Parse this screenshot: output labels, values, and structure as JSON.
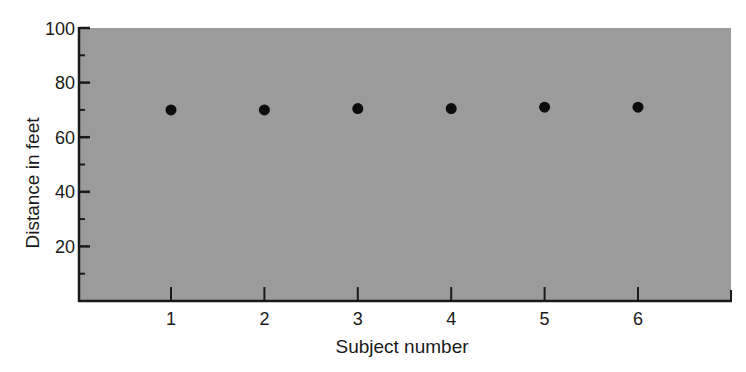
{
  "chart_data": {
    "type": "scatter",
    "title": "",
    "xlabel": "Subject number",
    "ylabel": "Distance in feet",
    "categories": [
      "1",
      "2",
      "3",
      "4",
      "5",
      "6"
    ],
    "x": [
      1,
      2,
      3,
      4,
      5,
      6
    ],
    "values": [
      70,
      70,
      70.5,
      70.5,
      71,
      71
    ],
    "series": [
      {
        "name": "Distance",
        "x": [
          1,
          2,
          3,
          4,
          5,
          6
        ],
        "values": [
          70,
          70,
          70.5,
          70.5,
          71,
          71
        ]
      }
    ],
    "xlim": [
      0,
      7
    ],
    "ylim": [
      0,
      100
    ],
    "yticks_major": [
      20,
      40,
      60,
      80,
      100
    ],
    "yticks_minor": [
      10,
      30,
      50,
      70,
      90
    ],
    "ytick_labels": [
      "20",
      "40",
      "60",
      "80",
      "100"
    ],
    "xticks": [
      1,
      2,
      3,
      4,
      5,
      6
    ],
    "xtick_labels": [
      "1",
      "2",
      "3",
      "4",
      "5",
      "6"
    ],
    "grid": false,
    "legend": null,
    "colors": {
      "plot_background": "#9b9b9b",
      "marker": "#0d0d0d",
      "axis": "#1a1a1a"
    }
  }
}
